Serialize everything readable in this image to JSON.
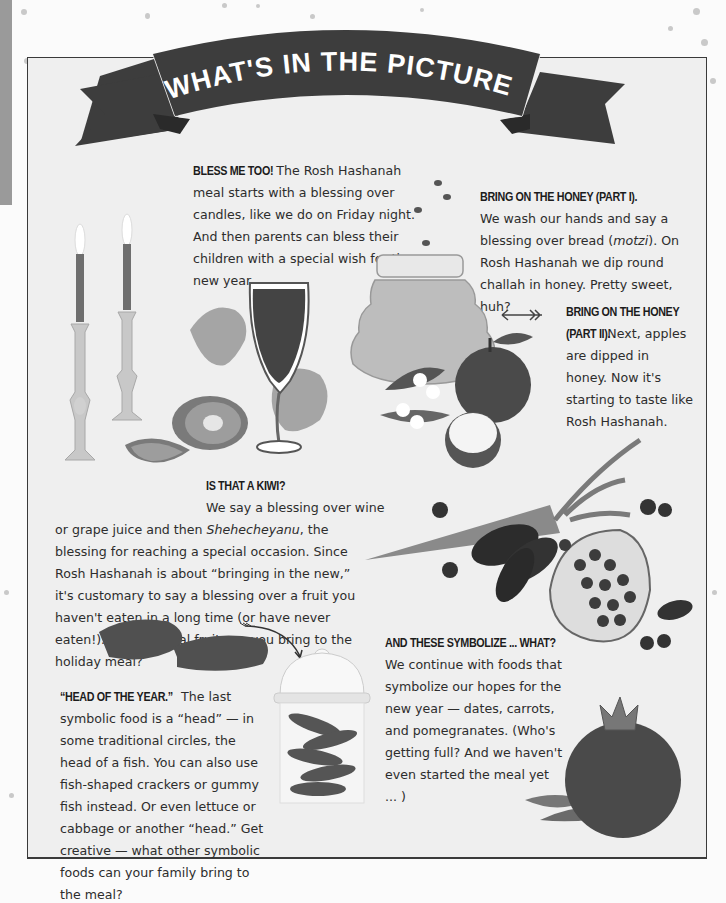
{
  "banner": {
    "title": "WHAT'S IN THE PICTURE?",
    "ribbon_color": "#3d3d3d",
    "text_color": "#ffffff"
  },
  "sections": {
    "bless": {
      "heading": "BLESS ME TOO!",
      "body": "The Rosh Hashanah meal starts with a blessing over candles, like we do on Friday night. And then parents can bless their children with a special wish for the new year."
    },
    "honey1": {
      "heading": "BRING ON THE HONEY (PART I).",
      "body_before": "We wash our hands and say a blessing over bread (",
      "body_italic": "motzi",
      "body_after": "). On Rosh Hashanah we dip round challah in honey. Pretty sweet, huh?"
    },
    "honey2": {
      "heading_line1": "BRING ON THE HONEY",
      "heading_line2": "(PART II).",
      "body": "Next, apples are dipped in honey. Now it's starting to taste like Rosh Hashanah."
    },
    "kiwi": {
      "heading": "IS THAT A KIWI?",
      "line1": "We say a blessing over wine",
      "body_before": "or grape juice and then ",
      "body_italic": "Shehecheyanu",
      "body_after": ", the blessing for reaching a special occasion. Since Rosh Hashanah is about “bringing in the new,” it's customary to say a blessing over a fruit you haven't eaten in a long time (or have never eaten!). What special fruit can you bring to the holiday meal?"
    },
    "symbolize": {
      "heading": "AND THESE SYMBOLIZE ... WHAT?",
      "body": "We continue with foods that symbolize our hopes for the new year — dates, carrots, and pomegranates. (Who's getting full? And we haven't even started the meal yet ... )"
    },
    "head": {
      "heading": "“HEAD OF THE YEAR.”",
      "body": "The last symbolic food is a “head” — in some traditional circles, the head of a fish. You can also use fish-shaped crackers or gummy fish instead. Or even lettuce or cabbage or another “head.” Get creative — what other symbolic foods can your family bring to the meal?"
    }
  },
  "illustrations": [
    "candles-icon",
    "wine-glass-icon",
    "grape-leaves-icon",
    "kiwi-icon",
    "honey-jar-icon",
    "bees-icon",
    "apples-icon",
    "flowers-icon",
    "carrot-icon",
    "dates-icon",
    "pomegranate-half-icon",
    "blueberries-icon",
    "gummy-fish-icon",
    "fish-jar-icon",
    "pomegranate-icon",
    "arrow-icon"
  ],
  "colors": {
    "panel_bg": "#efefef",
    "page_bg": "#fbfbfb",
    "text": "#2d2d2d",
    "border": "#3a3a3a"
  }
}
